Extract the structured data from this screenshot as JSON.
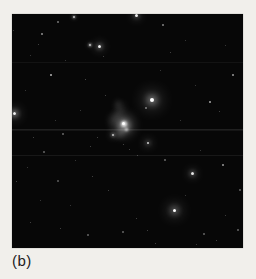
{
  "figure": {
    "label": "(b)"
  },
  "colors": {
    "page_background": "#f1efeb",
    "photo_background": "#070707",
    "star_color": "#ffffff",
    "label_color": "#1c1c1c"
  },
  "photo": {
    "x": 12,
    "y": 14,
    "width": 231,
    "height": 234
  },
  "stars": [
    {
      "x": 152,
      "y": 100,
      "s": 4,
      "o": 1.0,
      "h": 7,
      "ho": 0.55
    },
    {
      "x": 174,
      "y": 210,
      "s": 3,
      "o": 1.0,
      "h": 6,
      "ho": 0.4
    },
    {
      "x": 14,
      "y": 113,
      "s": 3,
      "o": 0.95,
      "h": 5,
      "ho": 0.4
    },
    {
      "x": 99,
      "y": 46,
      "s": 3,
      "o": 0.95,
      "h": 4,
      "ho": 0.35
    },
    {
      "x": 136,
      "y": 15,
      "s": 3,
      "o": 0.95,
      "h": 4,
      "ho": 0.3
    },
    {
      "x": 192,
      "y": 173,
      "s": 3,
      "o": 0.9,
      "h": 4,
      "ho": 0.3
    },
    {
      "x": 148,
      "y": 143,
      "s": 2,
      "o": 0.85,
      "h": 4,
      "ho": 0.3
    },
    {
      "x": 113,
      "y": 135,
      "s": 2,
      "o": 0.8,
      "h": 3,
      "ho": 0.3
    },
    {
      "x": 90,
      "y": 45,
      "s": 2,
      "o": 0.8,
      "h": 2,
      "ho": 0.3
    },
    {
      "x": 74,
      "y": 17,
      "s": 2,
      "o": 0.8,
      "h": 2,
      "ho": 0.25
    },
    {
      "x": 51,
      "y": 75,
      "s": 2,
      "o": 0.7
    },
    {
      "x": 210,
      "y": 102,
      "s": 2,
      "o": 0.65
    },
    {
      "x": 233,
      "y": 75,
      "s": 2,
      "o": 0.6
    },
    {
      "x": 223,
      "y": 165,
      "s": 2,
      "o": 0.6
    },
    {
      "x": 42,
      "y": 34,
      "s": 2,
      "o": 0.55
    },
    {
      "x": 163,
      "y": 25,
      "s": 2,
      "o": 0.5
    },
    {
      "x": 146,
      "y": 108,
      "s": 2,
      "o": 0.45
    },
    {
      "x": 58,
      "y": 22,
      "s": 2,
      "o": 0.45
    },
    {
      "x": 165,
      "y": 160,
      "s": 2,
      "o": 0.4
    },
    {
      "x": 63,
      "y": 134,
      "s": 2,
      "o": 0.4
    },
    {
      "x": 44,
      "y": 152,
      "s": 2,
      "o": 0.38
    },
    {
      "x": 240,
      "y": 190,
      "s": 2,
      "o": 0.38
    },
    {
      "x": 88,
      "y": 235,
      "s": 2,
      "o": 0.38
    },
    {
      "x": 123,
      "y": 232,
      "s": 2,
      "o": 0.38
    },
    {
      "x": 204,
      "y": 234,
      "s": 2,
      "o": 0.38
    },
    {
      "x": 238,
      "y": 230,
      "s": 2,
      "o": 0.38
    },
    {
      "x": 58,
      "y": 181,
      "s": 2,
      "o": 0.35
    },
    {
      "x": 85,
      "y": 79,
      "s": 1,
      "o": 0.35
    },
    {
      "x": 38,
      "y": 44,
      "s": 1,
      "o": 0.3
    },
    {
      "x": 103,
      "y": 56,
      "s": 1,
      "o": 0.3
    },
    {
      "x": 170,
      "y": 52,
      "s": 1,
      "o": 0.3
    },
    {
      "x": 219,
      "y": 111,
      "s": 1,
      "o": 0.3
    },
    {
      "x": 97,
      "y": 137,
      "s": 1,
      "o": 0.3
    },
    {
      "x": 33,
      "y": 137,
      "s": 1,
      "o": 0.3
    },
    {
      "x": 129,
      "y": 149,
      "s": 1,
      "o": 0.3
    },
    {
      "x": 90,
      "y": 146,
      "s": 1,
      "o": 0.3
    },
    {
      "x": 123,
      "y": 144,
      "s": 1,
      "o": 0.3
    },
    {
      "x": 137,
      "y": 155,
      "s": 1,
      "o": 0.3
    },
    {
      "x": 16,
      "y": 181,
      "s": 1,
      "o": 0.3
    },
    {
      "x": 92,
      "y": 176,
      "s": 1,
      "o": 0.3
    },
    {
      "x": 108,
      "y": 190,
      "s": 1,
      "o": 0.3
    },
    {
      "x": 30,
      "y": 222,
      "s": 1,
      "o": 0.3
    },
    {
      "x": 60,
      "y": 228,
      "s": 1,
      "o": 0.3
    },
    {
      "x": 147,
      "y": 230,
      "s": 1,
      "o": 0.3
    },
    {
      "x": 136,
      "y": 218,
      "s": 1,
      "o": 0.3
    },
    {
      "x": 155,
      "y": 243,
      "s": 1,
      "o": 0.3
    },
    {
      "x": 216,
      "y": 240,
      "s": 1,
      "o": 0.3
    },
    {
      "x": 196,
      "y": 244,
      "s": 1,
      "o": 0.25
    },
    {
      "x": 27,
      "y": 167,
      "s": 1,
      "o": 0.25
    },
    {
      "x": 70,
      "y": 205,
      "s": 1,
      "o": 0.25
    },
    {
      "x": 185,
      "y": 195,
      "s": 1,
      "o": 0.25
    },
    {
      "x": 225,
      "y": 215,
      "s": 1,
      "o": 0.28
    },
    {
      "x": 40,
      "y": 200,
      "s": 1,
      "o": 0.25
    },
    {
      "x": 200,
      "y": 150,
      "s": 1,
      "o": 0.25
    },
    {
      "x": 75,
      "y": 160,
      "s": 1,
      "o": 0.25
    },
    {
      "x": 180,
      "y": 120,
      "s": 1,
      "o": 0.25
    },
    {
      "x": 195,
      "y": 85,
      "s": 1,
      "o": 0.25
    },
    {
      "x": 225,
      "y": 45,
      "s": 1,
      "o": 0.25
    },
    {
      "x": 185,
      "y": 40,
      "s": 1,
      "o": 0.25
    },
    {
      "x": 160,
      "y": 70,
      "s": 1,
      "o": 0.25
    },
    {
      "x": 105,
      "y": 95,
      "s": 1,
      "o": 0.3
    },
    {
      "x": 80,
      "y": 110,
      "s": 1,
      "o": 0.25
    },
    {
      "x": 55,
      "y": 120,
      "s": 1,
      "o": 0.25
    },
    {
      "x": 25,
      "y": 90,
      "s": 1,
      "o": 0.25
    },
    {
      "x": 30,
      "y": 55,
      "s": 1,
      "o": 0.25
    },
    {
      "x": 65,
      "y": 60,
      "s": 1,
      "o": 0.25
    },
    {
      "x": 13,
      "y": 30,
      "s": 1,
      "o": 0.25
    }
  ],
  "galaxy": {
    "blobs": [
      {
        "x": 124,
        "y": 125,
        "w": 22,
        "h": 24,
        "blur": 4,
        "o": 0.18,
        "rot": 0
      },
      {
        "x": 124,
        "y": 125,
        "w": 12,
        "h": 13,
        "blur": 2.5,
        "o": 0.35,
        "rot": 0
      },
      {
        "x": 124,
        "y": 124,
        "w": 6,
        "h": 6,
        "blur": 1,
        "o": 0.75,
        "rot": 0
      },
      {
        "x": 123,
        "y": 123,
        "w": 3,
        "h": 3,
        "blur": 0.5,
        "o": 1.0,
        "rot": 0
      },
      {
        "x": 126,
        "y": 129,
        "w": 3,
        "h": 3,
        "blur": 0.8,
        "o": 0.8,
        "rot": 0
      },
      {
        "x": 119,
        "y": 111,
        "w": 7,
        "h": 18,
        "blur": 3,
        "o": 0.14,
        "rot": 20
      },
      {
        "x": 113,
        "y": 120,
        "w": 9,
        "h": 12,
        "blur": 3,
        "o": 0.12,
        "rot": 0
      },
      {
        "x": 120,
        "y": 134,
        "w": 8,
        "h": 7,
        "blur": 2.5,
        "o": 0.15,
        "rot": 0
      },
      {
        "x": 117,
        "y": 104,
        "w": 5,
        "h": 8,
        "blur": 2.5,
        "o": 0.12,
        "rot": 15
      }
    ]
  },
  "scan_lines": [
    {
      "y": 62,
      "o": 0.05
    },
    {
      "y": 129,
      "o": 0.1
    },
    {
      "y": 130,
      "o": 0.06
    },
    {
      "y": 155,
      "o": 0.07
    }
  ]
}
